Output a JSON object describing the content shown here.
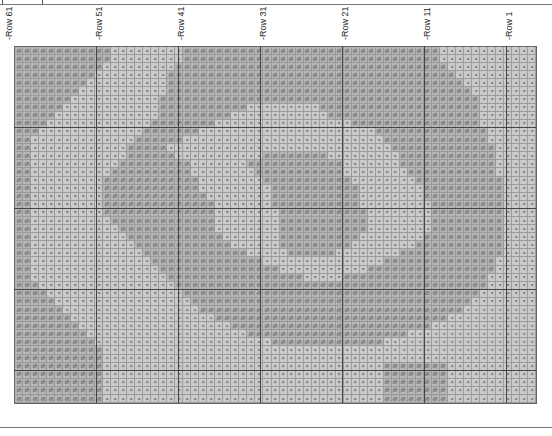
{
  "chart": {
    "orientation": "rotated-90",
    "symbols": {
      "S": "S",
      "X": "×"
    },
    "row_labels": [
      {
        "label": "-Row 61",
        "x": 4
      },
      {
        "label": "-Row 51",
        "x": 94
      },
      {
        "label": "-Row 41",
        "x": 176
      },
      {
        "label": "-Row 31",
        "x": 258
      },
      {
        "label": "-Row 21",
        "x": 340
      },
      {
        "label": "-Row 11",
        "x": 422
      },
      {
        "label": "-Row 1",
        "x": 504
      }
    ],
    "columns": 65,
    "rows": [
      "SSSSSSSSSSSSXXXXXXXXXSSSSSSSSSSSSSSSSSSSSSSSSSSSSSSSSXXXXXXXXXXXX",
      "SSSSSSSSSSSSXXXXXXXXXSSSSSSSSSSSSSSSSSSSSSSSSSSSSSSSSXXXXXXXXXXXX",
      "SSSSSSSSSSSXXXXXXXXXSSSSSSSSSSSSSSSSSSSSSSSSSSSSSSSSSSXXXXXXXXXXX",
      "SSSSSSSSSSXXXXXXXXXSSSSSSSSSSSSSSSSSSSSSSSSSSSSSSSSSSSSXXXXXXXXXX",
      "SSSSSSSSSXXXXXXXXXXSSSSSSSSSSSSSSSSSSSSSSSSSSSSSSSSSSSSSXXXXXXXXX",
      "SSSSSSSSXXXXXXXXXXXSSSSSSSSSSSSSSSSSSSSSSSSSSSSSSSSSSSSSSXXXXXXXX",
      "SSSSSSSXXXXXXXXXXXSSSSSSSSSSSSSSSSSSSSSSSSSSSSSSSSSSSSSSSSXXXXXXX",
      "SSSSSSXXXXXXXXXXXXSSSSSSSSSSSXXXXXXXXXSSSSSSSSSSSSSSSSSSSSXXXXXXX",
      "SSSSSXXXXXXXXXXXXXSSSSSSSSSXXXXXXXXXXXXSSSSSSSSSSSSSSSSSSSXXXXXXX",
      "SSSSXXXXXXXXXXXXXSSSSSSSSXXXXXXXXXXXXXXXXXSSSSSSSSSSSSSSSSXXXXXXX",
      "SSSXXXXXXXXXXXXXSSSSSSSXXXXXXXXXXXXXXXXXXXXXXSSSSSSSSSSSSSSXXXXXX",
      "SSXXXXXXXXXXXXXSSSSSSXXXXXXXXXXXXXXXXXXXXXXXXXSSSSSSSSSSSSSXXXXXX",
      "SSXXXXXXXXXXXXSSSSSXXXXXXXXXXXXXXXXXXXXXXXXXXXXSSSSSSSSSSSSSXXXXX",
      "SSXXXXXXXXXXXXSSSSSSXXXXXXXXXXXSSSSSSSSXXXXXXXXXSSSSSSSSSSSSXXXXX",
      "SSXXXXXXXXXXXSSSSSSSSSXXXXXXXSSSSSSSSSSSSXXXXXXXSSSSSSSSSSSSXXXXX",
      "SSXXXXXXXXXXSSSSSSSSSSXXXXXXXXSSSSSSSSSSSXXXXXXXXSSSSSSSSSSSXXXXX",
      "SSXXXXXXXXXSSSSSSSSSSSSXXXXXXXXSSSSSSSSSSSXXXXXXXXSSSSSSSSSSSXXXX",
      "SSXXXXXXXXXSSSSSSSSSSSSXXXXXXXXXSSSSSSSSSSSXXXXXXXXSSSSSSSSSSXXXX",
      "SSXXXXXXXXXSSSSSSSSSSSSSXXXXXXXXSSSSSSSSSSSXXXXXXXXSSSSSSSSSSXXXX",
      "SSXXXXXXXXXSSSSSSSSSSSSSSXXXXXXXSSSSSSSSSSSXXXXXXXXXSSSSSSSSSXXXX",
      "SSXXXXXXXXXSSSSSSSSSSSSSSXXXXXXXXSSSSSSSSSSSXXXXXXXXSSSSSSSSSXXXX",
      "SSXXXXXXXXXXSSSSSSSSSSSSSXXXXXXXXSSSSSSSSSSSXXXXXXXXSSSSSSSSSXXXX",
      "SSXXXXXXXXXXXSSSSSSSSSSSSXXXXXXXXSSSSSSSSSSSXXXXXXXXSSSSSSSSSXXXX",
      "SSXXXXXXXXXXXXSSSSSSSSSSSSXXXXXXXSSSSSSSSSSXXXXXXXXSSSSSSSSSSXXXX",
      "SSXXXXXXXXXXXXXSSSSSSSSSSSSXXXXXXSSSSSSSSSXXXXXXXXSSSSSSSSSSSXXXX",
      "SSXXXXXXXXXXXXXXSSSSSSSSSSSSSXXXXXSSSSSSXXXXXXXXSSSSSSSSSSSSSXXXX",
      "SSXXXXXXXXXXXXXXXSSSSSSSSSSSSSSXXXXXXXXXXXXXXXSSSSSSSSSSSSSSXXXXX",
      "SSXXXXXXXXXXXXXXXXSSSSSSSSSSSSSSSXXXXXXXXXXXSSSSSSSSSSSSSSSSXXXXX",
      "SSXXXXXXXXXXXXXXXXXSSSSSSSSSSSSSSSSSXXXXXSSSSSSSSSSSSSSSSSSXXXXXX",
      "SSSXXXXXXXXXXXXXXXXXSSSSSSSSSSSSSSSSSSSSSSSSSSSSSSSSSSSSSSSXXXXXX",
      "SSSSXXXXXXXXXXXXXXXXXSSSSSSSSSSSSSSSSSSSSSSSSSSSSSSSSSSSSSXXXXXXX",
      "SSSSSXXXXXXXXXXXXXXXXXSSSSSSSSSSSSSSSSSSSSSSSSSSSSSSSSSSSXXXXXXXX",
      "SSSSSSXXXXXXXXXXXXXXXXXSSSSSSSSSSSSSSSSSSSSSSSSSSSSSSSSSXXXXXXXXX",
      "SSSSSSSXXXXXXXXXXXXXXXXXXSSSSSSSSSSSSSSSSSSSSSSSSSSSSSXXXXXXXXXXX",
      "SSSSSSSSXXXXXXXXXXXXXXXXXXXSSSSSSSSSSSSSSSSSSSSSSSSSXXXXXXXXXXXXX",
      "SSSSSSSSSXXXXXXXXXXXXXXXXXXXXSSSSSSSSSSSSSSSSSSSSXXXXXXXXXXXXXXXX",
      "SSSSSSSSSSXXXXXXXXXXXXXXXXXXXXXXSSSSSSSSSSSSSSXXXXXXXXXXXXXXXXXXX",
      "SSSSSSSSSSSXXXXXXXXXXXXXXXXXXXXXXXXXXXXXXXXXXXXXXXXXXXXXXXXXXXXXX",
      "SSSSSSSSSSSXXXXXXXXXXXXXXXXXXXXXXXXXXXXXXXXXXXXXXXXXXXXXXXXXXXXXX",
      "SSSSSSSSSSSXXXXXXXXXXXXXXXXXXXXXXXXXXXXXXXXXXXSSSSSSSSXXXXXXXXXXX",
      "SSSSSSSSSSSXXXXXXXXXXXXXXXXXXXXXXXXXXXXXXXXXXXSSSSSSSSXXXXXXXXXXX",
      "SSSSSSSSSSSXXXXXXXXXXXXXXXXXXXXXXXXXXXXXXXXXXXSSSSSSSSXXXXXXXXXXX",
      "SSSSSSSSSSSXXXXXXXXXXXXXXXXXXXXXXXXXXXXXXXXXXXSSSSSSSSXXXXXXXXXXX",
      "SSSSSSSSSSSXXXXXXXXXXXXXXXXXXXXXXXXXXXXXXXXXXXSSSSSSSSXXXXXXXXXXX"
    ]
  }
}
